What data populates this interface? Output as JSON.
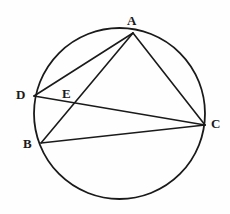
{
  "figure": {
    "background_color": "#fefefe",
    "stroke_color": "#1a1a1a",
    "label_color": "#1a1a1a",
    "width": 230,
    "height": 214
  },
  "circle": {
    "name": "circumscribed-circle",
    "cx": 119.5,
    "cy": 113.5,
    "r": 85.5,
    "stroke_width": 1.8
  },
  "points": [
    {
      "id": "A",
      "label": "A",
      "x": 133,
      "y": 33,
      "label_x": 127,
      "label_y": 14,
      "on_circle": true
    },
    {
      "id": "D",
      "label": "D",
      "x": 34,
      "y": 96,
      "label_x": 16,
      "label_y": 88,
      "on_circle": true
    },
    {
      "id": "B",
      "label": "B",
      "x": 41,
      "y": 143,
      "label_x": 23,
      "label_y": 137,
      "on_circle": true
    },
    {
      "id": "C",
      "label": "C",
      "x": 205,
      "y": 125,
      "label_x": 211,
      "label_y": 117,
      "on_circle": true
    },
    {
      "id": "E",
      "label": "E",
      "x": 72,
      "y": 104,
      "label_x": 62,
      "label_y": 87,
      "on_circle": false
    }
  ],
  "segments": [
    {
      "id": "AD",
      "from": "A",
      "to": "D",
      "x1": 133,
      "y1": 33,
      "x2": 34,
      "y2": 96,
      "stroke_width": 1.6
    },
    {
      "id": "AB",
      "from": "A",
      "to": "B",
      "x1": 133,
      "y1": 33,
      "x2": 41,
      "y2": 143,
      "stroke_width": 1.6
    },
    {
      "id": "AC",
      "from": "A",
      "to": "C",
      "x1": 133,
      "y1": 33,
      "x2": 205,
      "y2": 125,
      "stroke_width": 1.6
    },
    {
      "id": "DC",
      "from": "D",
      "to": "C",
      "x1": 34,
      "y1": 96,
      "x2": 205,
      "y2": 125,
      "stroke_width": 1.6
    },
    {
      "id": "BC",
      "from": "B",
      "to": "C",
      "x1": 41,
      "y1": 143,
      "x2": 205,
      "y2": 125,
      "stroke_width": 1.6
    }
  ],
  "labels": {
    "A": "A",
    "B": "B",
    "C": "C",
    "D": "D",
    "E": "E"
  }
}
